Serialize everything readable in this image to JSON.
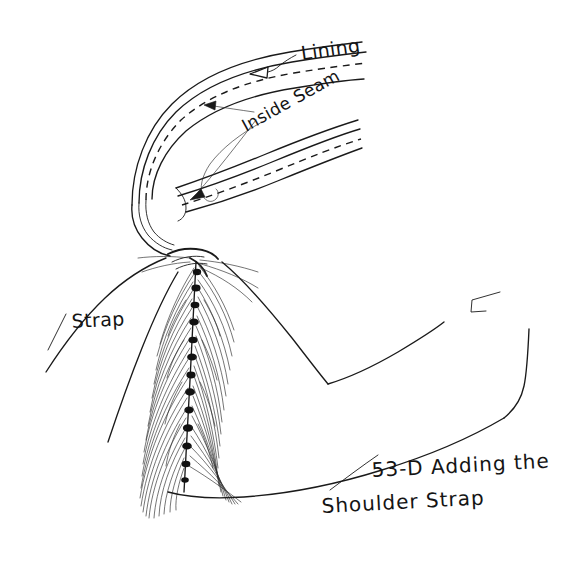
{
  "figure": {
    "title": "53-D Adding the Shoulder Strap",
    "background_color": "#ffffff",
    "ink_color": "#1a1a1a",
    "width": 565,
    "height": 575
  },
  "labels": {
    "lining": "Lining",
    "inside_seam": "Inside Seam",
    "strap": "Strap"
  },
  "caption": {
    "line1": "53-D Adding the",
    "line2": "Shoulder Strap",
    "figure_number": "53-D"
  }
}
